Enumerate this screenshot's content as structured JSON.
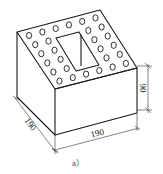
{
  "figure": {
    "caption": "a）",
    "colors": {
      "line": "#1a1a1a",
      "background": "#ffffff"
    }
  },
  "dimensions": {
    "length_label": "190",
    "width_label": "190",
    "height_label": "90"
  },
  "holes": {
    "small_round_count": 32,
    "central_rectangular_count": 1
  }
}
